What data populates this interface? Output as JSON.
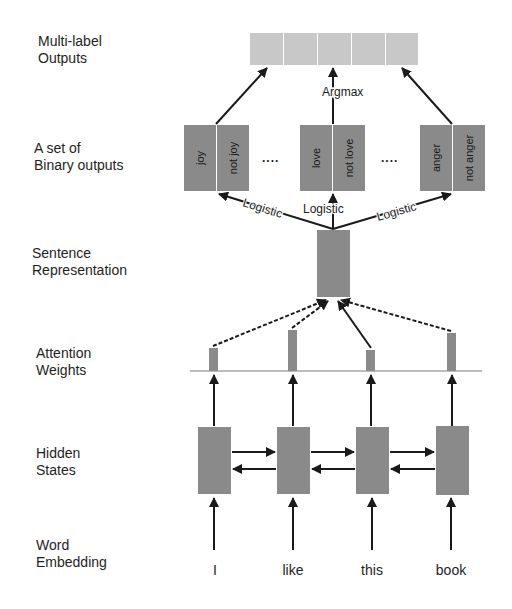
{
  "diagram": {
    "type": "attention-based multi-label classification architecture",
    "layers": [
      {
        "id": "multi_label_outputs",
        "label_line1": "Multi-label",
        "label_line2": "Outputs"
      },
      {
        "id": "binary_outputs",
        "label_line1": "A set of",
        "label_line2": "Binary outputs"
      },
      {
        "id": "sentence_representation",
        "label_line1": "Sentence",
        "label_line2": "Representation"
      },
      {
        "id": "attention_weights",
        "label_line1": "Attention",
        "label_line2": "Weights"
      },
      {
        "id": "hidden_states",
        "label_line1": "Hidden",
        "label_line2": "States"
      },
      {
        "id": "word_embedding",
        "label_line1": "Word",
        "label_line2": "Embedding"
      }
    ],
    "multi_label_cells": 5,
    "argmax_label": "Argmax",
    "binary_groups": [
      {
        "pos": "joy",
        "neg": "not joy"
      },
      {
        "pos": "love",
        "neg": "not love"
      },
      {
        "pos": "anger",
        "neg": "not anger"
      }
    ],
    "ellipsis": "....",
    "logistic_label": "Logistic",
    "words": [
      "I",
      "like",
      "this",
      "book"
    ],
    "attention_heights": [
      22,
      40,
      20,
      37
    ],
    "colors": {
      "output_bar": "#c8c8c8",
      "box": "#8a8a8a",
      "arrow": "#1a1a1a",
      "baseline": "#bdbdbd"
    }
  }
}
